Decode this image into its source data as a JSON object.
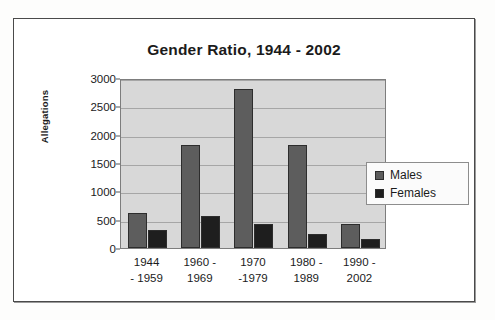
{
  "figure": {
    "frame_border_color": "#4a4a4a",
    "page_background": "#fdfdfc"
  },
  "chart_data": {
    "type": "bar",
    "title": "Gender Ratio, 1944 - 2002",
    "xlabel": "",
    "ylabel": "Allegations",
    "categories": [
      "1944 - 1959",
      "1960 - 1969",
      "1970 -1979",
      "1980 - 1989",
      "1990 - 2002"
    ],
    "category_lines": [
      {
        "line1": "1944",
        "line2": "- 1959"
      },
      {
        "line1": "1960 -",
        "line2": "1969"
      },
      {
        "line1": "1970",
        "line2": "-1979"
      },
      {
        "line1": "1980 -",
        "line2": "1989"
      },
      {
        "line1": "1990 -",
        "line2": "2002"
      }
    ],
    "series": [
      {
        "name": "Males",
        "color": "#5d5d5d",
        "values": [
          620,
          1820,
          2810,
          1820,
          430
        ]
      },
      {
        "name": "Females",
        "color": "#1e1e1e",
        "values": [
          310,
          560,
          420,
          240,
          160
        ]
      }
    ],
    "ylim": [
      0,
      3000
    ],
    "ytick_values": [
      3000,
      2500,
      2000,
      1500,
      1000,
      500,
      0
    ],
    "ytick_labels": [
      "3000",
      "2500",
      "2000",
      "1500",
      "1000",
      "500",
      "0"
    ],
    "grid": true,
    "legend_position": "right-middle",
    "plot_background": "#d8d8d8"
  },
  "legend": {
    "items": [
      {
        "label": "Males",
        "swatch": "males"
      },
      {
        "label": "Females",
        "swatch": "females"
      }
    ]
  }
}
